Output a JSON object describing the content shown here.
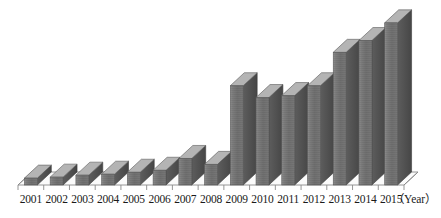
{
  "chart_data": {
    "type": "bar",
    "title": "",
    "subtitle": "",
    "xlabel": "（Year）",
    "ylabel": "",
    "grid": false,
    "legend": null,
    "style": "3d-column",
    "axis_unit_label": "（Year）",
    "categories": [
      "2001",
      "2002",
      "2003",
      "2004",
      "2005",
      "2006",
      "2007",
      "2008",
      "2009",
      "2010",
      "2011",
      "2012",
      "2013",
      "2014",
      "2015"
    ],
    "values": [
      7,
      8,
      10,
      11,
      13,
      15,
      27,
      21,
      101,
      89,
      91,
      101,
      135,
      147,
      165
    ],
    "ylim": [
      0,
      175
    ],
    "bar_face_color": "#767676",
    "bar_side_color": "#4f4f4f",
    "bar_top_color": "#a8a8a8",
    "axis_line_color": "#8a8a8a",
    "label_color": "#1a1a1a"
  }
}
